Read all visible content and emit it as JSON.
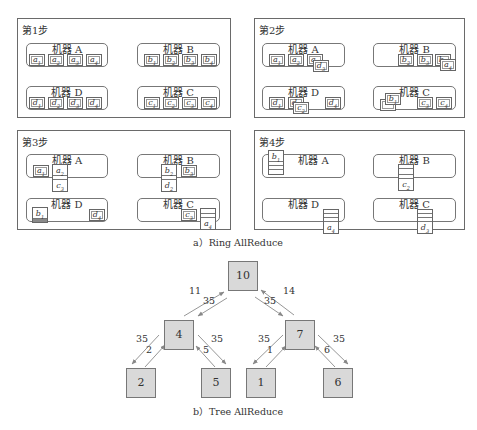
{
  "figure_a": {
    "caption": "a）Ring AllReduce",
    "steps": [
      {
        "title": "第1步",
        "machines": {
          "A": {
            "label": "机器 A",
            "chunks": [
              "a1",
              "a2",
              "a3",
              "a4"
            ]
          },
          "B": {
            "label": "机器 B",
            "chunks": [
              "b1",
              "b2",
              "b3",
              "b4"
            ]
          },
          "D": {
            "label": "机器 D",
            "chunks": [
              "d1",
              "d2",
              "d3",
              "d4"
            ]
          },
          "C": {
            "label": "机器 C",
            "chunks": [
              "c1",
              "c2",
              "c3",
              "c4"
            ]
          }
        }
      },
      {
        "title": "第2步",
        "machines": {
          "A": {
            "label": "机器 A",
            "chunks": [
              "a1",
              "a2",
              "a3",
              "d3"
            ]
          },
          "B": {
            "label": "机器 B",
            "chunks": [
              "b2",
              "b3",
              "b4",
              "a4"
            ]
          },
          "D": {
            "label": "机器 D",
            "chunks": [
              "d1",
              "d2",
              "c2",
              "d4"
            ]
          },
          "C": {
            "label": "机器 C",
            "chunks": [
              "c1",
              "b1",
              "c3",
              "c4"
            ]
          }
        }
      },
      {
        "title": "第3步",
        "machines": {
          "A": {
            "label": "机器 A",
            "chunks": [
              "a1",
              "a2",
              "c3"
            ]
          },
          "B": {
            "label": "机器 B",
            "chunks": [
              "b2",
              "d2",
              "b3"
            ]
          },
          "D": {
            "label": "机器 D",
            "chunks": [
              "b1",
              "d4"
            ]
          },
          "C": {
            "label": "机器 C",
            "chunks": [
              "c3",
              "c4",
              "a4"
            ]
          }
        }
      },
      {
        "title": "第4步",
        "machines": {
          "A": {
            "label": "机器 A",
            "chunks": [
              "b1"
            ]
          },
          "B": {
            "label": "机器 B",
            "chunks": [
              "a2",
              "b2",
              "c2"
            ]
          },
          "D": {
            "label": "机器 D",
            "chunks": [
              "a4"
            ]
          },
          "C": {
            "label": "机器 C",
            "chunks": [
              "d3"
            ]
          }
        }
      }
    ]
  },
  "figure_b": {
    "caption": "b）Tree AllReduce",
    "nodes": {
      "root": "10",
      "left": "4",
      "right": "7",
      "ll": "2",
      "lr": "5",
      "rl": "1",
      "rr": "6"
    },
    "edge_labels": {
      "left_up": "11",
      "left_down": "35",
      "right_down": "35",
      "right_up": "14",
      "ll_down": "35",
      "ll_up": "2",
      "lr_down": "35",
      "lr_up": "5",
      "rl_down": "35",
      "rl_up": "1",
      "rr_down": "35",
      "rr_up": "6"
    }
  },
  "colors": {
    "node_fill": "#d9d9d9",
    "border": "#6a6a6a",
    "arrow": "#888888"
  }
}
